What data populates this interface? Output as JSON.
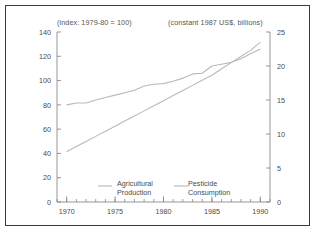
{
  "figure": {
    "caption_left": "(index: 1979-80 = 100)",
    "caption_right": "(constant 1987 US$, billions)",
    "line_color": "#b9b9b9",
    "axis_color": "#8a8a8a",
    "border_color": "#3a3a3a",
    "text_color": "#4a4a4a"
  },
  "legend": {
    "series1_line1": "Agricultural",
    "series1_line2": "Production",
    "series2_line1": "Pesticide",
    "series2_line2": "Consumption"
  },
  "chart_data": {
    "type": "line",
    "title": "",
    "xlabel": "",
    "ylabel": "",
    "grid": false,
    "legend_position": "inside-bottom-center",
    "x": [
      1970,
      1971,
      1972,
      1973,
      1974,
      1975,
      1976,
      1977,
      1978,
      1979,
      1980,
      1981,
      1982,
      1983,
      1984,
      1985,
      1986,
      1987,
      1988,
      1989,
      1990
    ],
    "xlim": [
      1969,
      1991
    ],
    "xticks": [
      1970,
      1975,
      1980,
      1985,
      1990
    ],
    "xticklabels": [
      "1970",
      "1975",
      "1980",
      "1985",
      "1990"
    ],
    "xminor_interval": 1,
    "axes": [
      {
        "id": "left",
        "label": "(index: 1979-80 = 100)",
        "ylim": [
          0,
          140
        ],
        "yticks": [
          0,
          20,
          40,
          60,
          80,
          100,
          120,
          140
        ],
        "yticklabels": [
          "0",
          "20",
          "40",
          "60",
          "80",
          "100",
          "120",
          "140"
        ]
      },
      {
        "id": "right",
        "label": "(constant 1987 US$, billions)",
        "ylim": [
          0,
          25
        ],
        "yticks": [
          0,
          5,
          10,
          15,
          20,
          25
        ],
        "yticklabels": [
          "0",
          "5",
          "10",
          "15",
          "20",
          "25"
        ]
      }
    ],
    "series": [
      {
        "name": "Agricultural Production",
        "axis": "left",
        "units": "index (1979-80 = 100)",
        "color": "#b9b9b9",
        "values": [
          80,
          81.5,
          81.5,
          84,
          86,
          88,
          90,
          92,
          95.5,
          97,
          97.5,
          99.5,
          102,
          105.5,
          106,
          112,
          113.5,
          115,
          118,
          122,
          126
        ]
      },
      {
        "name": "Pesticide Consumption",
        "axis": "right",
        "units": "constant 1987 US$, billions",
        "color": "#b9b9b9",
        "values": [
          7.4,
          8.15,
          8.9,
          9.65,
          10.4,
          11.15,
          11.9,
          12.65,
          13.4,
          14.15,
          14.9,
          15.65,
          16.4,
          17.15,
          17.9,
          18.65,
          19.6,
          20.5,
          21.4,
          22.3,
          23.5
        ]
      }
    ]
  }
}
